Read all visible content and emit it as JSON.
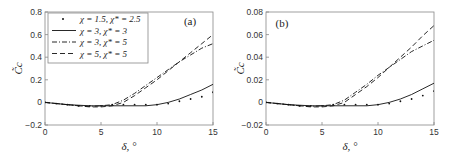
{
  "chart_data": [
    {
      "type": "line",
      "panel_label": "(a)",
      "xlabel": "δ, °",
      "ylabel": "C̃_c",
      "xlim": [
        0,
        15
      ],
      "ylim": [
        -0.2,
        0.8
      ],
      "xticks": [
        "0",
        "5",
        "10",
        "15"
      ],
      "yticks": [
        "-0.2",
        "0",
        "0.2",
        "0.4",
        "0.6",
        "0.8"
      ],
      "grid": false,
      "legend_position": "upper left",
      "series": [
        {
          "name": "χ = 1.5, χ* = 2.5",
          "style": "dots",
          "x": [
            0,
            1,
            2,
            3,
            4,
            5,
            6,
            7,
            8,
            9,
            10,
            11,
            12,
            13,
            14,
            15
          ],
          "values": [
            0,
            -0.01,
            -0.02,
            -0.03,
            -0.03,
            -0.03,
            -0.02,
            -0.02,
            -0.02,
            -0.02,
            -0.02,
            -0.01,
            0.01,
            0.03,
            0.05,
            0.09
          ]
        },
        {
          "name": "χ = 3, χ* = 3",
          "style": "solid",
          "x": [
            0,
            1,
            2,
            3,
            4,
            5,
            6,
            7,
            8,
            9,
            10,
            11,
            12,
            13,
            14,
            15
          ],
          "values": [
            0,
            -0.01,
            -0.02,
            -0.025,
            -0.03,
            -0.03,
            -0.03,
            -0.03,
            -0.03,
            -0.03,
            -0.02,
            0.0,
            0.03,
            0.07,
            0.11,
            0.16
          ]
        },
        {
          "name": "χ = 3, χ* = 5",
          "style": "dashdot",
          "x": [
            0,
            1,
            2,
            3,
            4,
            5,
            6,
            7,
            8,
            9,
            10,
            11,
            12,
            13,
            14,
            15
          ],
          "values": [
            0,
            -0.01,
            -0.02,
            -0.03,
            -0.035,
            -0.03,
            -0.02,
            0.02,
            0.08,
            0.15,
            0.22,
            0.29,
            0.36,
            0.42,
            0.48,
            0.52
          ]
        },
        {
          "name": "χ = 5, χ* = 5",
          "style": "dashed",
          "x": [
            0,
            1,
            2,
            3,
            4,
            5,
            6,
            7,
            8,
            9,
            10,
            11,
            12,
            13,
            14,
            15
          ],
          "values": [
            0,
            -0.01,
            -0.02,
            -0.03,
            -0.04,
            -0.04,
            -0.03,
            0.0,
            0.06,
            0.13,
            0.2,
            0.28,
            0.36,
            0.44,
            0.52,
            0.6
          ]
        }
      ]
    },
    {
      "type": "line",
      "panel_label": "(b)",
      "xlabel": "δ, °",
      "ylabel": "C̃_c",
      "xlim": [
        0,
        15
      ],
      "ylim": [
        -0.02,
        0.08
      ],
      "xticks": [
        "0",
        "5",
        "10",
        "15"
      ],
      "yticks": [
        "-0.02",
        "0",
        "0.02",
        "0.04",
        "0.06",
        "0.08"
      ],
      "grid": false,
      "series": [
        {
          "name": "χ = 1.5, χ* = 2.5",
          "style": "dots",
          "x": [
            0,
            1,
            2,
            3,
            4,
            5,
            6,
            7,
            8,
            9,
            10,
            11,
            12,
            13,
            14,
            15
          ],
          "values": [
            0,
            -0.001,
            -0.002,
            -0.003,
            -0.003,
            -0.003,
            -0.002,
            -0.002,
            -0.002,
            -0.002,
            -0.002,
            -0.001,
            0.001,
            0.003,
            0.006,
            0.01
          ]
        },
        {
          "name": "χ = 3, χ* = 3",
          "style": "solid",
          "x": [
            0,
            1,
            2,
            3,
            4,
            5,
            6,
            7,
            8,
            9,
            10,
            11,
            12,
            13,
            14,
            15
          ],
          "values": [
            0,
            -0.001,
            -0.002,
            -0.0025,
            -0.003,
            -0.003,
            -0.003,
            -0.003,
            -0.003,
            -0.003,
            -0.002,
            0.0,
            0.003,
            0.007,
            0.012,
            0.017
          ]
        },
        {
          "name": "χ = 3, χ* = 5",
          "style": "dashdot",
          "x": [
            0,
            1,
            2,
            3,
            4,
            5,
            6,
            7,
            8,
            9,
            10,
            11,
            12,
            13,
            14,
            15
          ],
          "values": [
            0,
            -0.001,
            -0.002,
            -0.003,
            -0.0035,
            -0.003,
            -0.002,
            0.002,
            0.009,
            0.016,
            0.024,
            0.031,
            0.038,
            0.045,
            0.05,
            0.055
          ]
        },
        {
          "name": "χ = 5, χ* = 5",
          "style": "dashed",
          "x": [
            0,
            1,
            2,
            3,
            4,
            5,
            6,
            7,
            8,
            9,
            10,
            11,
            12,
            13,
            14,
            15
          ],
          "values": [
            0,
            -0.001,
            -0.002,
            -0.003,
            -0.004,
            -0.004,
            -0.003,
            0.0,
            0.007,
            0.014,
            0.022,
            0.031,
            0.04,
            0.049,
            0.059,
            0.068
          ]
        }
      ]
    }
  ],
  "legend": [
    {
      "label": "χ = 1.5, χ* = 2.5"
    },
    {
      "label": "χ = 3, χ* = 3"
    },
    {
      "label": "χ = 3, χ* = 5"
    },
    {
      "label": "χ = 5, χ* = 5"
    }
  ],
  "labels": {
    "panel_a": "(a)",
    "panel_b": "(b)",
    "xlabel": "δ, °",
    "ylabel": "C̃c"
  }
}
